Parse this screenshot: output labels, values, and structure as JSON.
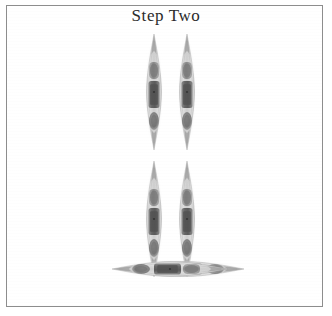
{
  "figure": {
    "title": "Step Two",
    "background_color": "#ffffff",
    "frame_color": "#8d8d8d",
    "title_color": "#2b2b2b",
    "width": 332,
    "height": 316
  },
  "palette": {
    "body_light": "#d9d9d9",
    "body_mid": "#bdbdbd",
    "body_edge": "#9a9a9a",
    "organ_dark": "#6f6f6f",
    "organ_darker": "#575757",
    "organ_mid": "#8a8a8a",
    "organ_light": "#a8a8a8",
    "tip_shadow": "#7e7e7e"
  },
  "specimens": [
    {
      "id": "top-left-specimen",
      "label": "Specimen 1",
      "orientation": "vertical",
      "x": 139,
      "y": 33,
      "width": 30,
      "height": 118
    },
    {
      "id": "top-right-specimen",
      "label": "Specimen 2",
      "orientation": "vertical",
      "x": 172,
      "y": 33,
      "width": 30,
      "height": 118
    },
    {
      "id": "middle-left-specimen",
      "label": "Specimen 3",
      "orientation": "vertical",
      "x": 139,
      "y": 160,
      "width": 30,
      "height": 118
    },
    {
      "id": "middle-right-specimen",
      "label": "Specimen 4",
      "orientation": "vertical",
      "x": 172,
      "y": 160,
      "width": 30,
      "height": 118
    },
    {
      "id": "bottom-left-specimen",
      "label": "Specimen 5",
      "orientation": "horizontal",
      "x": 39,
      "y": 254,
      "width": 118,
      "height": 30
    },
    {
      "id": "bottom-right-specimen",
      "label": "Specimen 6",
      "orientation": "horizontal",
      "x": 199,
      "y": 254,
      "width": 118,
      "height": 30
    }
  ]
}
